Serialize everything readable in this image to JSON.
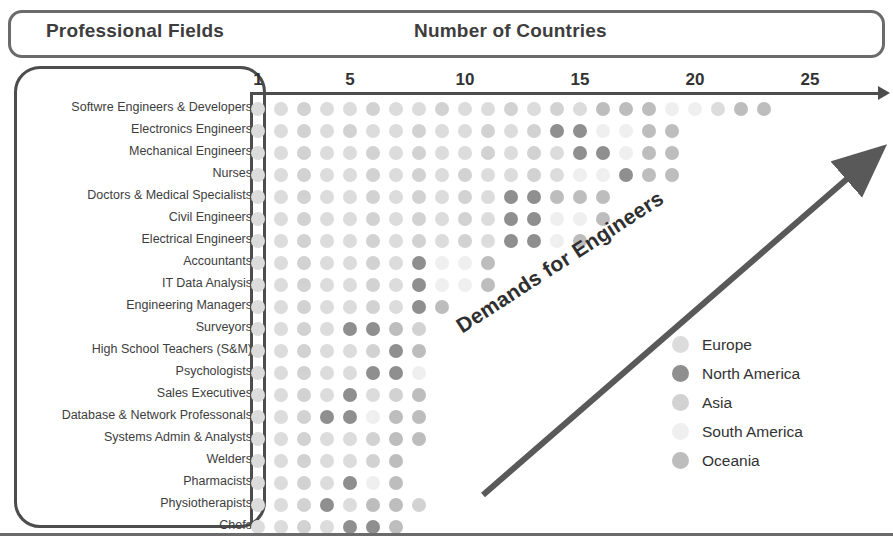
{
  "header": {
    "fields_title": "Professional Fields",
    "countries_title": "Number of Countries"
  },
  "annotation": {
    "diagonal_label": "Demands for Engineers"
  },
  "axis": {
    "tick_labels": [
      "1",
      "5",
      "10",
      "15",
      "20",
      "25"
    ],
    "tick_values": [
      1,
      5,
      10,
      15,
      20,
      25
    ],
    "unit_px": 23.0,
    "origin_px": 258
  },
  "legend": {
    "items": [
      {
        "label": "Europe",
        "color": "#dcdcdc"
      },
      {
        "label": "North America",
        "color": "#8f8f8f"
      },
      {
        "label": "Asia",
        "color": "#d2d2d2"
      },
      {
        "label": "South America",
        "color": "#efefef"
      },
      {
        "label": "Oceania",
        "color": "#bdbdbd"
      }
    ]
  },
  "chart_data": {
    "type": "dot-matrix",
    "title": "Number of Countries",
    "xlabel": "Number of Countries",
    "ylabel": "Professional Fields",
    "xlim": [
      0,
      27
    ],
    "xticks": [
      1,
      5,
      10,
      15,
      20,
      25
    ],
    "grid": false,
    "legend_position": "right",
    "legend": [
      "Europe",
      "North America",
      "Asia",
      "South America",
      "Oceania"
    ],
    "region_colors": {
      "Europe": "#dcdcdc",
      "North America": "#8f8f8f",
      "Asia": "#d2d2d2",
      "South America": "#efefef",
      "Oceania": "#bdbdbd"
    },
    "categories": [
      "Softwre Engineers & Developers",
      "Electronics Engineers",
      "Mechanical Engineers",
      "Nurses",
      "Doctors & Medical Specialists",
      "Civil Engineers",
      "Electrical Engineers",
      "Accountants",
      "IT Data Analysis",
      "Engineering Managers",
      "Surveyors",
      "High School Teachers (S&M)",
      "Psychologists",
      "Sales Executives",
      "Database & Network Professonals",
      "Systems Admin & Analysts",
      "Welders",
      "Pharmacists",
      "Physiotherapists",
      "Chefs"
    ],
    "values": [
      23,
      19,
      19,
      19,
      16,
      16,
      15,
      11,
      11,
      9,
      8,
      8,
      8,
      8,
      8,
      8,
      7,
      7,
      8,
      7
    ],
    "rows": [
      {
        "category": "Softwre Engineers & Developers",
        "count": 23,
        "dots": [
          "#dcdcdc",
          "#dcdcdc",
          "#d2d2d2",
          "#dcdcdc",
          "#dcdcdc",
          "#d2d2d2",
          "#dcdcdc",
          "#dcdcdc",
          "#d2d2d2",
          "#dcdcdc",
          "#dcdcdc",
          "#d2d2d2",
          "#dcdcdc",
          "#d2d2d2",
          "#dcdcdc",
          "#bdbdbd",
          "#bdbdbd",
          "#bdbdbd",
          "#efefef",
          "#efefef",
          "#dcdcdc",
          "#bdbdbd",
          "#bdbdbd"
        ]
      },
      {
        "category": "Electronics Engineers",
        "count": 19,
        "dots": [
          "#dcdcdc",
          "#dcdcdc",
          "#d2d2d2",
          "#dcdcdc",
          "#d2d2d2",
          "#dcdcdc",
          "#dcdcdc",
          "#d2d2d2",
          "#dcdcdc",
          "#dcdcdc",
          "#d2d2d2",
          "#dcdcdc",
          "#d2d2d2",
          "#8f8f8f",
          "#8f8f8f",
          "#efefef",
          "#efefef",
          "#bdbdbd",
          "#bdbdbd"
        ]
      },
      {
        "category": "Mechanical Engineers",
        "count": 19,
        "dots": [
          "#dcdcdc",
          "#dcdcdc",
          "#d2d2d2",
          "#dcdcdc",
          "#dcdcdc",
          "#d2d2d2",
          "#dcdcdc",
          "#d2d2d2",
          "#dcdcdc",
          "#dcdcdc",
          "#d2d2d2",
          "#dcdcdc",
          "#d2d2d2",
          "#dcdcdc",
          "#8f8f8f",
          "#8f8f8f",
          "#efefef",
          "#bdbdbd",
          "#bdbdbd"
        ]
      },
      {
        "category": "Nurses",
        "count": 19,
        "dots": [
          "#dcdcdc",
          "#dcdcdc",
          "#d2d2d2",
          "#dcdcdc",
          "#dcdcdc",
          "#d2d2d2",
          "#dcdcdc",
          "#d2d2d2",
          "#dcdcdc",
          "#d2d2d2",
          "#dcdcdc",
          "#dcdcdc",
          "#d2d2d2",
          "#dcdcdc",
          "#efefef",
          "#efefef",
          "#8f8f8f",
          "#bdbdbd",
          "#bdbdbd"
        ]
      },
      {
        "category": "Doctors & Medical Specialists",
        "count": 16,
        "dots": [
          "#dcdcdc",
          "#dcdcdc",
          "#d2d2d2",
          "#dcdcdc",
          "#dcdcdc",
          "#d2d2d2",
          "#dcdcdc",
          "#d2d2d2",
          "#dcdcdc",
          "#d2d2d2",
          "#dcdcdc",
          "#8f8f8f",
          "#8f8f8f",
          "#bdbdbd",
          "#bdbdbd",
          "#bdbdbd"
        ]
      },
      {
        "category": "Civil Engineers",
        "count": 16,
        "dots": [
          "#dcdcdc",
          "#dcdcdc",
          "#d2d2d2",
          "#dcdcdc",
          "#dcdcdc",
          "#d2d2d2",
          "#dcdcdc",
          "#d2d2d2",
          "#dcdcdc",
          "#d2d2d2",
          "#dcdcdc",
          "#8f8f8f",
          "#8f8f8f",
          "#efefef",
          "#efefef",
          "#bdbdbd"
        ]
      },
      {
        "category": "Electrical Engineers",
        "count": 15,
        "dots": [
          "#dcdcdc",
          "#dcdcdc",
          "#d2d2d2",
          "#dcdcdc",
          "#dcdcdc",
          "#d2d2d2",
          "#dcdcdc",
          "#d2d2d2",
          "#dcdcdc",
          "#d2d2d2",
          "#dcdcdc",
          "#8f8f8f",
          "#8f8f8f",
          "#efefef",
          "#bdbdbd"
        ]
      },
      {
        "category": "Accountants",
        "count": 11,
        "dots": [
          "#dcdcdc",
          "#dcdcdc",
          "#d2d2d2",
          "#dcdcdc",
          "#dcdcdc",
          "#d2d2d2",
          "#dcdcdc",
          "#8f8f8f",
          "#efefef",
          "#efefef",
          "#bdbdbd"
        ]
      },
      {
        "category": "IT Data Analysis",
        "count": 11,
        "dots": [
          "#dcdcdc",
          "#dcdcdc",
          "#d2d2d2",
          "#dcdcdc",
          "#dcdcdc",
          "#d2d2d2",
          "#dcdcdc",
          "#8f8f8f",
          "#efefef",
          "#efefef",
          "#bdbdbd"
        ]
      },
      {
        "category": "Engineering Managers",
        "count": 9,
        "dots": [
          "#dcdcdc",
          "#dcdcdc",
          "#d2d2d2",
          "#dcdcdc",
          "#dcdcdc",
          "#d2d2d2",
          "#dcdcdc",
          "#8f8f8f",
          "#bdbdbd"
        ]
      },
      {
        "category": "Surveyors",
        "count": 8,
        "dots": [
          "#dcdcdc",
          "#dcdcdc",
          "#d2d2d2",
          "#dcdcdc",
          "#8f8f8f",
          "#8f8f8f",
          "#bdbdbd",
          "#d2d2d2"
        ]
      },
      {
        "category": "High School Teachers (S&M)",
        "count": 8,
        "dots": [
          "#dcdcdc",
          "#dcdcdc",
          "#d2d2d2",
          "#dcdcdc",
          "#dcdcdc",
          "#d2d2d2",
          "#8f8f8f",
          "#bdbdbd"
        ]
      },
      {
        "category": "Psychologists",
        "count": 8,
        "dots": [
          "#dcdcdc",
          "#dcdcdc",
          "#d2d2d2",
          "#dcdcdc",
          "#dcdcdc",
          "#8f8f8f",
          "#8f8f8f",
          "#efefef"
        ]
      },
      {
        "category": "Sales Executives",
        "count": 8,
        "dots": [
          "#dcdcdc",
          "#dcdcdc",
          "#d2d2d2",
          "#dcdcdc",
          "#8f8f8f",
          "#dcdcdc",
          "#d2d2d2",
          "#bdbdbd"
        ]
      },
      {
        "category": "Database & Network Professonals",
        "count": 8,
        "dots": [
          "#dcdcdc",
          "#dcdcdc",
          "#d2d2d2",
          "#8f8f8f",
          "#8f8f8f",
          "#efefef",
          "#bdbdbd",
          "#bdbdbd"
        ]
      },
      {
        "category": "Systems Admin & Analysts",
        "count": 8,
        "dots": [
          "#dcdcdc",
          "#dcdcdc",
          "#d2d2d2",
          "#dcdcdc",
          "#dcdcdc",
          "#d2d2d2",
          "#bdbdbd",
          "#bdbdbd"
        ]
      },
      {
        "category": "Welders",
        "count": 7,
        "dots": [
          "#dcdcdc",
          "#dcdcdc",
          "#d2d2d2",
          "#dcdcdc",
          "#dcdcdc",
          "#d2d2d2",
          "#bdbdbd"
        ]
      },
      {
        "category": "Pharmacists",
        "count": 7,
        "dots": [
          "#dcdcdc",
          "#dcdcdc",
          "#d2d2d2",
          "#dcdcdc",
          "#8f8f8f",
          "#efefef",
          "#bdbdbd"
        ]
      },
      {
        "category": "Physiotherapists",
        "count": 8,
        "dots": [
          "#dcdcdc",
          "#dcdcdc",
          "#d2d2d2",
          "#8f8f8f",
          "#dcdcdc",
          "#bdbdbd",
          "#bdbdbd",
          "#d2d2d2"
        ]
      },
      {
        "category": "Chefs",
        "count": 7,
        "dots": [
          "#dcdcdc",
          "#dcdcdc",
          "#d2d2d2",
          "#dcdcdc",
          "#8f8f8f",
          "#8f8f8f",
          "#bdbdbd"
        ]
      }
    ]
  }
}
